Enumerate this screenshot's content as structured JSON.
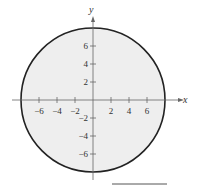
{
  "chart_data": {
    "type": "region",
    "title": "",
    "xlabel": "x",
    "ylabel": "y",
    "shape": "circle",
    "center": [
      0,
      0
    ],
    "radius": 8,
    "equation": "x^2 + y^2 <= 64",
    "fill": "#eeeeee",
    "stroke": "#222222",
    "xlim": [
      -9.5,
      10.5
    ],
    "ylim": [
      -10,
      10
    ],
    "x_ticks": [
      -6,
      -4,
      -2,
      2,
      4,
      6
    ],
    "y_ticks": [
      6,
      4,
      2,
      -2,
      -4,
      -6
    ],
    "x_tick_labels": [
      "−6",
      "−4",
      "−2",
      "2",
      "4",
      "6"
    ],
    "y_tick_labels": [
      "6",
      "4",
      "2",
      "−2",
      "−4",
      "−6"
    ],
    "grid": false
  },
  "answer_blank": ""
}
